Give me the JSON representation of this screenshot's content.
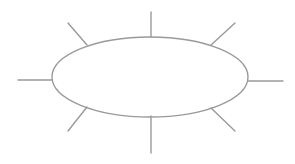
{
  "diagram": {
    "type": "spider-diagram",
    "stroke_color": "#9a9a9a",
    "stroke_width": 1.4,
    "background": "#ffffff",
    "center_node": {
      "shape": "ellipse",
      "cx": 150,
      "cy": 77,
      "rx": 98,
      "ry": 40,
      "label": ""
    },
    "spokes": [
      {
        "name": "spoke-top",
        "x1": 151,
        "y1": 37,
        "x2": 151,
        "y2": 12
      },
      {
        "name": "spoke-top-right",
        "x1": 211,
        "y1": 45,
        "x2": 235,
        "y2": 23
      },
      {
        "name": "spoke-right",
        "x1": 248,
        "y1": 81,
        "x2": 283,
        "y2": 81
      },
      {
        "name": "spoke-bottom-right",
        "x1": 211,
        "y1": 108,
        "x2": 235,
        "y2": 131
      },
      {
        "name": "spoke-bottom",
        "x1": 151,
        "y1": 116,
        "x2": 151,
        "y2": 153
      },
      {
        "name": "spoke-bottom-left",
        "x1": 87,
        "y1": 107,
        "x2": 68,
        "y2": 131
      },
      {
        "name": "spoke-left",
        "x1": 52,
        "y1": 80,
        "x2": 18,
        "y2": 80
      },
      {
        "name": "spoke-top-left",
        "x1": 87,
        "y1": 45,
        "x2": 68,
        "y2": 23
      }
    ]
  }
}
